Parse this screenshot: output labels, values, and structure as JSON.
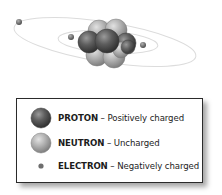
{
  "diagram": {
    "nucleus": {
      "protons_visible": 4,
      "neutrons_visible": 5
    },
    "electrons_visible": 3,
    "orbits_visible": 2
  },
  "legend": {
    "items": [
      {
        "name": "PROTON",
        "separator": " – ",
        "description": "Positively charged",
        "icon": "proton-sphere-icon",
        "color": "#5a5a5a"
      },
      {
        "name": "NEUTRON",
        "separator": " – ",
        "description": "Uncharged",
        "icon": "neutron-sphere-icon",
        "color": "#a8a8a8"
      },
      {
        "name": "ELECTRON",
        "separator": " – ",
        "description": "Negatively charged",
        "icon": "electron-dot-icon",
        "color": "#6e6e6e"
      }
    ]
  },
  "colors": {
    "proton": "#5a5a5a",
    "neutron": "#a8a8a8",
    "electron": "#6e6e6e",
    "orbit": "#d8d8d8",
    "border": "#2a2a2a"
  }
}
